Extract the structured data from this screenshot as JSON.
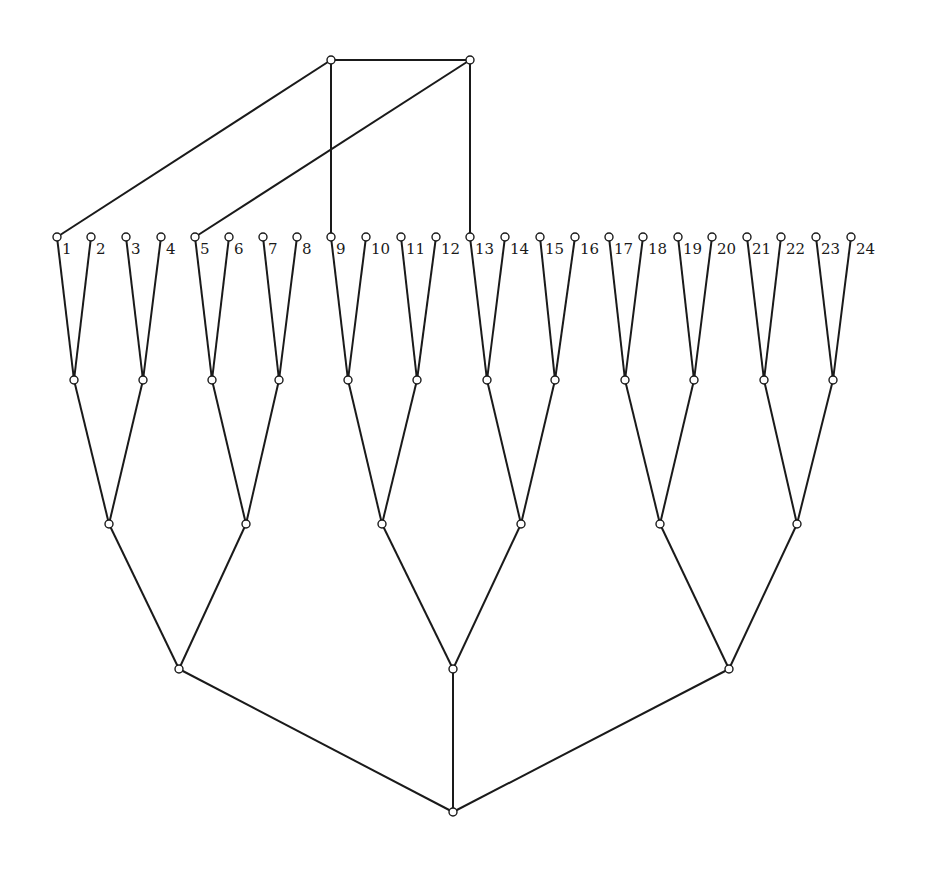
{
  "diagram": {
    "type": "tree-graph",
    "leaf_labels": [
      "1",
      "2",
      "3",
      "4",
      "5",
      "6",
      "7",
      "8",
      "9",
      "10",
      "11",
      "12",
      "13",
      "14",
      "15",
      "16",
      "17",
      "18",
      "19",
      "20",
      "21",
      "22",
      "23",
      "24"
    ],
    "node_radius": 4,
    "nodes": {
      "top": [
        {
          "id": "T1",
          "x": 331,
          "y": 60
        },
        {
          "id": "T2",
          "x": 470,
          "y": 60
        }
      ],
      "leaves_y": 237,
      "leaves_x": [
        57,
        91,
        126,
        161,
        195,
        229,
        263,
        297,
        331,
        366,
        401,
        436,
        470,
        505,
        540,
        575,
        609,
        643,
        678,
        712,
        747,
        781,
        816,
        851
      ],
      "level1_y": 380,
      "level1_x": [
        74,
        143,
        212,
        279,
        348,
        417,
        487,
        555,
        625,
        694,
        764,
        833
      ],
      "level2_y": 524,
      "level2_x": [
        109,
        246,
        382,
        521,
        660,
        797
      ],
      "level3_y": 669,
      "level3_x": [
        179,
        453,
        729
      ],
      "root": {
        "x": 453,
        "y": 812
      }
    },
    "top_edges": [
      {
        "from": "T1",
        "to": "T2"
      },
      {
        "from": "T1",
        "to": "leaf-1"
      },
      {
        "from": "T1",
        "to": "leaf-9"
      },
      {
        "from": "T2",
        "to": "leaf-5"
      },
      {
        "from": "T2",
        "to": "leaf-13"
      }
    ],
    "structure": {
      "level1_children": "pairs of leaves (1-2, 3-4, ..., 23-24)",
      "level2_children": "pairs of level1 nodes",
      "level3_children": "pairs of level2 nodes",
      "root_children": "three level3 nodes"
    }
  }
}
